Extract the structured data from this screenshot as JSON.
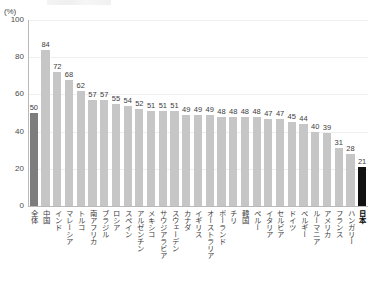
{
  "unit_label": "(%)",
  "colors": {
    "bar_default": "#c6c6c6",
    "bar_total": "#7d7d7d",
    "bar_highlight": "#121212",
    "axis": "#b9b9b9",
    "grid": "#efefef",
    "text": "#3d3d3d"
  },
  "chart_data": {
    "type": "bar",
    "title": "",
    "xlabel": "",
    "ylabel": "(%)",
    "ylim": [
      0,
      100
    ],
    "yticks": [
      0,
      20,
      40,
      60,
      80,
      100
    ],
    "grid": true,
    "legend": "none",
    "categories": [
      "全体",
      "中国",
      "インド",
      "マレーシア",
      "トルコ",
      "南アフリカ",
      "ブラジル",
      "ロシア",
      "スペイン",
      "アルゼンチン",
      "メキシコ",
      "サウジアラビア",
      "スウェーデン",
      "カナダ",
      "イギリス",
      "オーストラリア",
      "ポーランド",
      "チリ",
      "韓国",
      "ペルー",
      "イタリア",
      "セルビア",
      "ドイツ",
      "ベルギー",
      "ルーマニア",
      "アメリカ",
      "フランス",
      "ハンガリー",
      "日本"
    ],
    "values": [
      50,
      84,
      72,
      68,
      62,
      57,
      57,
      55,
      54,
      52,
      51,
      51,
      51,
      49,
      49,
      49,
      48,
      48,
      48,
      48,
      47,
      47,
      45,
      44,
      40,
      39,
      31,
      28,
      21
    ],
    "emphasis": {
      "total_index": 0,
      "highlight_index": 28
    }
  }
}
